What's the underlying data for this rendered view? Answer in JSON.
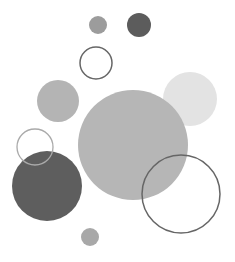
{
  "canvas": {
    "width": 235,
    "height": 262,
    "background": "#ffffff"
  },
  "circles": [
    {
      "name": "small-gray-top",
      "cx": 98,
      "cy": 25,
      "r": 9,
      "fill": "#9c9c9c",
      "stroke": "none",
      "sw": 0
    },
    {
      "name": "dark-top",
      "cx": 139,
      "cy": 25,
      "r": 12,
      "fill": "#5c5c5c",
      "stroke": "none",
      "sw": 0
    },
    {
      "name": "outline-top",
      "cx": 96,
      "cy": 63,
      "r": 16,
      "fill": "none",
      "stroke": "#666666",
      "sw": 1.5
    },
    {
      "name": "medium-gray-left",
      "cx": 58,
      "cy": 101,
      "r": 21,
      "fill": "#b4b4b4",
      "stroke": "none",
      "sw": 0
    },
    {
      "name": "light-right",
      "cx": 190,
      "cy": 99,
      "r": 27,
      "fill": "#e3e3e3",
      "stroke": "none",
      "sw": 0
    },
    {
      "name": "big-gray-center",
      "cx": 133,
      "cy": 145,
      "r": 55,
      "fill": "#b6b6b6",
      "stroke": "none",
      "sw": 0
    },
    {
      "name": "dark-big-left",
      "cx": 47,
      "cy": 186,
      "r": 35,
      "fill": "#5e5e5e",
      "stroke": "none",
      "sw": 0
    },
    {
      "name": "thin-outline-left",
      "cx": 35,
      "cy": 147,
      "r": 18,
      "fill": "none",
      "stroke": "#aaaaaa",
      "sw": 1.3
    },
    {
      "name": "outline-right",
      "cx": 181,
      "cy": 194,
      "r": 39,
      "fill": "none",
      "stroke": "#666666",
      "sw": 1.5
    },
    {
      "name": "small-gray-bottom",
      "cx": 90,
      "cy": 237,
      "r": 9,
      "fill": "#a8a8a8",
      "stroke": "none",
      "sw": 0
    }
  ]
}
